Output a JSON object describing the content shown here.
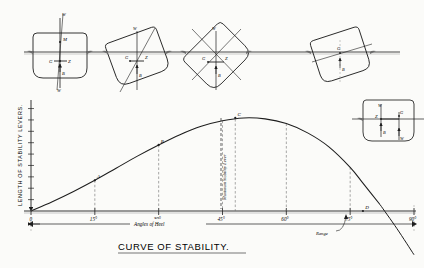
{
  "figure": {
    "title": "CURVE OF STABILITY.",
    "y_axis_label": "LENGTH OF STABILITY LEVERS.",
    "x_axis_label": "Angles of Heel",
    "range_label": "Range",
    "max_lever_label": "Maximum Stability Lever",
    "ink": "#1d1d1d",
    "paper": "#fbfbf9",
    "guide": "#8e8e8e"
  },
  "chart_data": {
    "type": "line",
    "title": "CURVE OF STABILITY.",
    "xlabel": "Angles of Heel",
    "ylabel": "LENGTH OF STABILITY LEVERS.",
    "xlim": [
      0,
      90
    ],
    "ylim": [
      0,
      1.15
    ],
    "grid": false,
    "xticks": [
      0,
      15,
      30,
      45,
      60,
      75,
      90
    ],
    "xticklabels": [
      "0",
      "15°",
      "30°",
      "45°",
      "60°",
      "75°",
      "90°"
    ],
    "yticks_count": 9,
    "yticklabels": [],
    "x": [
      0,
      5,
      10,
      15,
      20,
      25,
      30,
      35,
      40,
      45,
      50,
      55,
      60,
      65,
      70,
      75,
      78,
      82,
      86,
      90
    ],
    "y": [
      0,
      0.1,
      0.21,
      0.33,
      0.46,
      0.59,
      0.71,
      0.82,
      0.91,
      0.97,
      1.0,
      0.99,
      0.94,
      0.84,
      0.69,
      0.47,
      0.3,
      0.07,
      -0.19,
      -0.47
    ],
    "annotations": [
      {
        "label": "A",
        "x": 15,
        "y": 0.33
      },
      {
        "label": "B",
        "x": 30,
        "y": 0.71
      },
      {
        "label": "C",
        "x": 48,
        "y": 1.0
      },
      {
        "label": "D",
        "x": 78,
        "y": 0.0
      }
    ],
    "vertical_drop_lines": [
      15,
      30,
      45,
      48,
      60,
      75,
      90
    ],
    "legend": []
  },
  "ship_sections": [
    {
      "id": "upright",
      "heel_deg": 0,
      "caption_points": [
        "W",
        "M",
        "G",
        "Z",
        "B",
        "W"
      ]
    },
    {
      "id": "heeled-small",
      "heel_deg": 20,
      "caption_points": [
        "W",
        "G",
        "Z",
        "B"
      ]
    },
    {
      "id": "heeled-mid",
      "heel_deg": 45,
      "caption_points": [
        "W",
        "G",
        "Z",
        "B"
      ]
    },
    {
      "id": "heeled-large",
      "heel_deg": 20,
      "caption_points": [
        "G",
        "B"
      ]
    },
    {
      "id": "heeled-extreme",
      "heel_deg": 0,
      "caption_points": [
        "W",
        "G",
        "Z",
        "B",
        "W"
      ]
    }
  ],
  "axis_ticks": {
    "x": [
      {
        "value": 0,
        "label": "0"
      },
      {
        "value": 15,
        "label": "15°"
      },
      {
        "value": 30,
        "label": "30°"
      },
      {
        "value": 45,
        "label": "45°"
      },
      {
        "value": 60,
        "label": "60°"
      },
      {
        "value": 75,
        "label": "75°"
      },
      {
        "value": 90,
        "label": "90°"
      }
    ]
  }
}
